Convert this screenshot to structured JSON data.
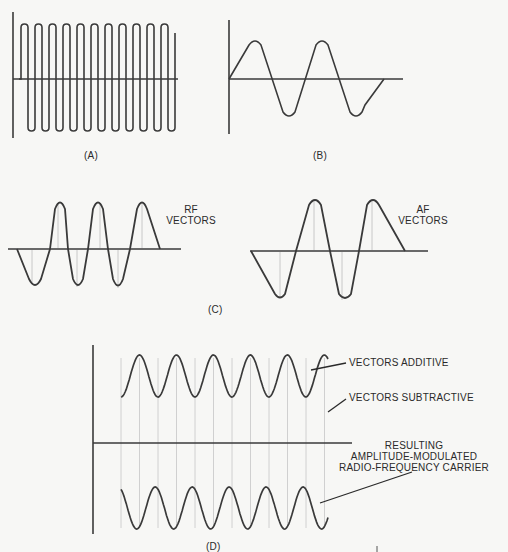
{
  "figure": {
    "panels": [
      {
        "id": "A",
        "label": "(A)",
        "description": "Radio-frequency carrier wave"
      },
      {
        "id": "B",
        "label": "(B)",
        "description": "Audio-frequency modulating wave"
      },
      {
        "id": "C",
        "label": "(C)",
        "description": "RF and AF vectors"
      },
      {
        "id": "D",
        "label": "(D)",
        "description": "Resulting amplitude-modulated RF carrier"
      }
    ],
    "labels": {
      "rf_vectors_line1": "RF",
      "rf_vectors_line2": "VECTORS",
      "af_vectors_line1": "AF",
      "af_vectors_line2": "VECTORS",
      "vectors_additive": "VECTORS ADDITIVE",
      "vectors_subtractive": "VECTORS SUBTRACTIVE",
      "resulting_line1": "RESULTING",
      "resulting_line2": "AMPLITUDE-MODULATED",
      "resulting_line3": "RADIO-FREQUENCY CARRIER"
    },
    "colors": {
      "stroke": "#3a3a3a",
      "vector": "#c8c8c8",
      "background": "#f7f7f5"
    }
  }
}
